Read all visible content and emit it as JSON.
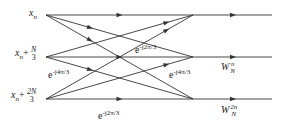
{
  "diagram": {
    "type": "radix-3 butterfly flow graph",
    "inputs": [
      {
        "base": "x",
        "sub": "n",
        "plus": "",
        "num": "",
        "den": ""
      },
      {
        "base": "x",
        "sub": "n",
        "plus": "+",
        "num": "N",
        "den": "3"
      },
      {
        "base": "x",
        "sub": "n",
        "plus": "+",
        "num": "2N",
        "den": "3"
      }
    ],
    "twiddle_labels": [
      {
        "base": "e",
        "exp": "-j2π/3"
      },
      {
        "base": "e",
        "exp": "-j4π/3"
      },
      {
        "base": "e",
        "exp": "-j4π/3"
      },
      {
        "base": "e",
        "exp": "-j2π/3"
      }
    ],
    "output_weights": [
      {
        "base": "W",
        "sup": "n",
        "sub": "N"
      },
      {
        "base": "W",
        "sup": "2n",
        "sub": "N"
      }
    ],
    "edges": [
      [
        0,
        0
      ],
      [
        0,
        1
      ],
      [
        0,
        2
      ],
      [
        1,
        0
      ],
      [
        1,
        1
      ],
      [
        1,
        2
      ],
      [
        2,
        0
      ],
      [
        2,
        1
      ],
      [
        2,
        2
      ]
    ],
    "line_color": "#333333"
  }
}
